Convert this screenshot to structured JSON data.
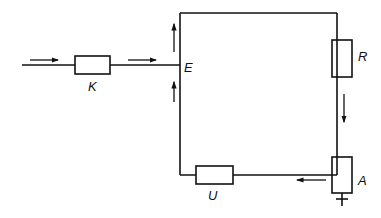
{
  "diagram": {
    "type": "block-circuit",
    "stroke_color": "#111111",
    "background": "#ffffff",
    "components": [
      {
        "id": "K",
        "label": "K",
        "kind": "block"
      },
      {
        "id": "E",
        "label": "E",
        "kind": "node"
      },
      {
        "id": "R",
        "label": "R",
        "kind": "block"
      },
      {
        "id": "A",
        "label": "A",
        "kind": "block"
      },
      {
        "id": "U",
        "label": "U",
        "kind": "block"
      }
    ],
    "connections": [
      {
        "from": "input",
        "to": "K"
      },
      {
        "from": "K",
        "to": "E"
      },
      {
        "from": "E",
        "to": "R"
      },
      {
        "from": "R",
        "to": "A"
      },
      {
        "from": "A",
        "to": "U"
      },
      {
        "from": "U",
        "to": "E"
      },
      {
        "from": "A",
        "to": "ground"
      }
    ],
    "flow_arrows": [
      {
        "location": "input-wire",
        "direction": "right"
      },
      {
        "location": "K-to-E",
        "direction": "right"
      },
      {
        "location": "left-upper",
        "direction": "up"
      },
      {
        "location": "left-lower",
        "direction": "up"
      },
      {
        "location": "right-between-R-A",
        "direction": "down"
      },
      {
        "location": "bottom-near-A",
        "direction": "left"
      }
    ]
  },
  "labels": {
    "K": "K",
    "E": "E",
    "R": "R",
    "A": "A",
    "U": "U"
  }
}
